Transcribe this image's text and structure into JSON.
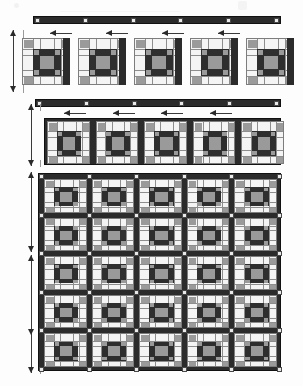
{
  "document": {
    "kind": "quilt-assembly-diagram",
    "title": "Quilt Top Assembly Diagram",
    "width": 303,
    "height": 386
  },
  "palette": {
    "background": "#fdfdfd",
    "sashing_dark": "#2b2b2b",
    "sashing_border": "#111111",
    "cornerstone_light": "#e9e9e9",
    "cornerstone_border": "#4a4a4a",
    "block_background": "#f2f2f2",
    "block_border": "#7d7d7d",
    "patch_dark": "#2e2e2e",
    "patch_medium_gray": "#9a9a9a",
    "patch_light": "#f4f4f4",
    "seam_line": "#8d8d8d",
    "arrow": "#2a2a2a"
  },
  "block_pattern": {
    "name": "nine-patch-square-in-a-square",
    "grid_units": 12,
    "center_patch": "medium-gray",
    "ring_patch": "dark",
    "corner_accents": "medium-gray",
    "field_patch": "light"
  },
  "sections": [
    {
      "id": "section-1",
      "label": "Sashing strip with cornerstones",
      "type": "sashing-strip",
      "cornerstone_count": 6,
      "strip": {
        "x": 33,
        "y": 16,
        "w": 248,
        "h": 8
      }
    },
    {
      "id": "section-2",
      "label": "Row of five separate blocks",
      "type": "block-row-separate",
      "block_count": 5,
      "arrow_count": 4,
      "arrow_direction": "left",
      "vertical_measure": true,
      "blocks": [
        {
          "x": 22,
          "y": 38,
          "w": 48,
          "h": 47
        },
        {
          "x": 78,
          "y": 38,
          "w": 48,
          "h": 47
        },
        {
          "x": 134,
          "y": 38,
          "w": 48,
          "h": 47
        },
        {
          "x": 190,
          "y": 38,
          "w": 48,
          "h": 47
        },
        {
          "x": 246,
          "y": 38,
          "w": 48,
          "h": 47
        }
      ]
    },
    {
      "id": "section-3",
      "label": "Sashing strip with cornerstones",
      "type": "sashing-strip",
      "cornerstone_count": 6,
      "strip": {
        "x": 35,
        "y": 99,
        "w": 246,
        "h": 8
      }
    },
    {
      "id": "section-4",
      "label": "Block row joined with vertical sashing",
      "type": "block-row-joined",
      "block_count": 5,
      "arrow_count": 4,
      "arrow_direction": "left",
      "vertical_measure": true,
      "row": {
        "x": 44,
        "y": 118,
        "w": 237,
        "h": 47
      }
    },
    {
      "id": "section-5",
      "label": "Completed quilt top, five by five blocks",
      "type": "block-grid",
      "rows": 5,
      "columns": 5,
      "vertical_measure": true,
      "grid": {
        "x": 38,
        "y": 173,
        "w": 243,
        "h": 198
      }
    }
  ],
  "arrows": {
    "horizontal_label": "press-seam-direction",
    "vertical_label": "row-height-measure"
  }
}
